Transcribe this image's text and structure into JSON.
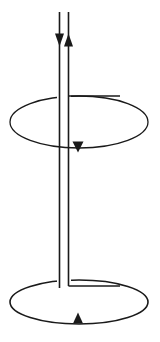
{
  "figure": {
    "title": "Two-wire vertical conductor threading two horizontal circular loops",
    "background_color": "#ffffff",
    "stroke_color": "#1a1a1a",
    "canvas": {
      "width": 160,
      "height": 342
    },
    "elements": {
      "left_wire_label": "left vertical conductor",
      "right_wire_label": "right vertical conductor",
      "upper_loop_label": "upper circular loop",
      "lower_loop_label": "lower circular loop",
      "left_wire_arrow_label": "downward current arrow",
      "right_wire_arrow_label": "upward current arrow",
      "upper_loop_arrow_label": "upper loop circulation arrow",
      "lower_loop_arrow_label": "lower loop circulation arrow"
    }
  },
  "chart_data": {
    "type": "diagram",
    "title": "",
    "xlabel": "",
    "ylabel": "",
    "stroke_color": "#1a1a1a",
    "background_color": "#ffffff",
    "geometry": {
      "left_wire": {
        "x": 59.5,
        "y_top": 12,
        "y_bottom": 288,
        "stroke_width": 1.6,
        "direction": "down"
      },
      "right_wire": {
        "x": 68.5,
        "y_top": 12,
        "y_bottom": 286,
        "stroke_width": 1.6,
        "direction": "up"
      },
      "upper_loop": {
        "cx": 79,
        "cy": 122,
        "rx": 69,
        "ry": 26,
        "stroke_width": 1.3,
        "connector_y": 96,
        "connector_x_from": 68.5,
        "connector_x_to": 120,
        "circulation": "down-at-front"
      },
      "lower_loop": {
        "cx": 79,
        "cy": 302,
        "rx": 69,
        "ry": 22,
        "stroke_width": 1.6,
        "connector_y": 286,
        "connector_x_from": 68.5,
        "connector_x_to": 120,
        "circulation": "up-at-front"
      },
      "arrows": [
        {
          "name": "left-wire-arrow",
          "x": 59.5,
          "y": 40,
          "direction": "down",
          "width": 9,
          "length": 13
        },
        {
          "name": "right-wire-arrow",
          "x": 68.5,
          "y": 40,
          "direction": "up",
          "width": 9,
          "length": 13
        },
        {
          "name": "upper-loop-arrow",
          "x": 78,
          "y": 147,
          "direction": "down",
          "width": 11,
          "length": 11
        },
        {
          "name": "lower-loop-arrow",
          "x": 78,
          "y": 318,
          "direction": "up",
          "width": 10,
          "length": 11
        }
      ]
    }
  }
}
